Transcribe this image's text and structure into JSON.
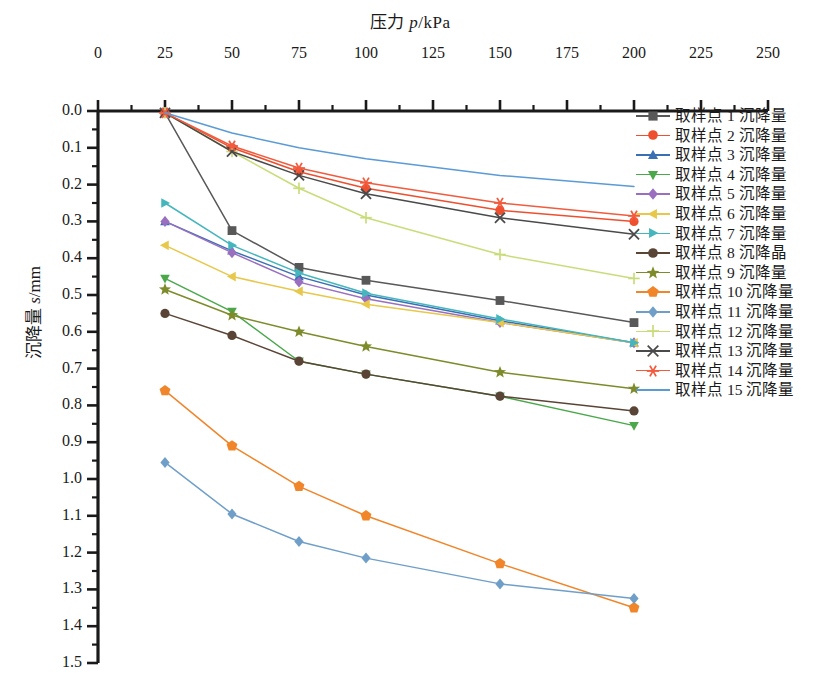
{
  "chart_data": {
    "type": "line",
    "title": "",
    "xlabel": "压力 p/kPa",
    "ylabel": "沉降量 s/mm",
    "xlabel_main": "压力 ",
    "xlabel_ital": "p",
    "xlabel_unit": "/kPa",
    "ylabel_main": "沉降量 ",
    "ylabel_ital": "s",
    "ylabel_unit": "/mm",
    "x_axis_position": "top",
    "y_axis_inverted": true,
    "grid": false,
    "legend_position": "right",
    "xlim": [
      0,
      250
    ],
    "ylim": [
      0.0,
      1.5
    ],
    "xticks": [
      0,
      25,
      50,
      75,
      100,
      125,
      150,
      175,
      200,
      225,
      250
    ],
    "xtick_labels": [
      "0",
      "25",
      "50",
      "75",
      "100",
      "125",
      "150",
      "175",
      "200",
      "225",
      "250"
    ],
    "x_minor_tick_interval": 12.5,
    "yticks": [
      0.0,
      0.1,
      0.2,
      0.3,
      0.4,
      0.5,
      0.6,
      0.7,
      0.8,
      0.9,
      1.0,
      1.1,
      1.2,
      1.3,
      1.4,
      1.5
    ],
    "ytick_labels": [
      "0.0",
      "0.1",
      "0.2",
      "0.3",
      "0.4",
      "0.5",
      "0.6",
      "0.7",
      "0.8",
      "0.9",
      "1.0",
      "1.1",
      "1.2",
      "1.3",
      "1.4",
      "1.5"
    ],
    "y_minor_tick_interval": 0.05,
    "x": [
      25,
      50,
      75,
      100,
      150,
      200
    ],
    "series": [
      {
        "name": "取样点 1 沉降量",
        "color": "#585858",
        "marker": "square",
        "values": [
          0.005,
          0.325,
          0.425,
          0.46,
          0.515,
          0.575
        ]
      },
      {
        "name": "取样点 2 沉降量",
        "color": "#ee4f2e",
        "marker": "circle",
        "values": [
          0.005,
          0.1,
          0.165,
          0.21,
          0.27,
          0.3
        ]
      },
      {
        "name": "取样点 3 沉降量",
        "color": "#3a6fb5",
        "marker": "triangle-up",
        "values": [
          0.3,
          0.38,
          0.45,
          0.5,
          0.57,
          0.63
        ]
      },
      {
        "name": "取样点 4 沉降量",
        "color": "#4aa84a",
        "marker": "triangle-down",
        "values": [
          0.455,
          0.545,
          0.68,
          0.715,
          0.775,
          0.855
        ]
      },
      {
        "name": "取样点 5 沉降量",
        "color": "#9a6fc0",
        "marker": "diamond",
        "values": [
          0.3,
          0.385,
          0.465,
          0.51,
          0.575,
          0.63
        ]
      },
      {
        "name": "取样点 6 沉降量",
        "color": "#e7c84a",
        "marker": "triangle-left",
        "values": [
          0.365,
          0.45,
          0.49,
          0.525,
          0.575,
          0.63
        ]
      },
      {
        "name": "取样点 7 沉降量",
        "color": "#45b6bd",
        "marker": "triangle-right",
        "values": [
          0.25,
          0.365,
          0.44,
          0.495,
          0.565,
          0.63
        ]
      },
      {
        "name": "取样点 8 沉降晶",
        "color": "#5a4436",
        "marker": "circle",
        "values": [
          0.55,
          0.61,
          0.68,
          0.715,
          0.775,
          0.815
        ]
      },
      {
        "name": "取样点 9 沉降量",
        "color": "#7d8b2a",
        "marker": "star",
        "values": [
          0.485,
          0.555,
          0.6,
          0.64,
          0.71,
          0.755
        ]
      },
      {
        "name": "取样点 10 沉降量",
        "color": "#f0852a",
        "marker": "pentagon",
        "values": [
          0.76,
          0.91,
          1.02,
          1.1,
          1.23,
          1.35
        ]
      },
      {
        "name": "取样点 11 沉降量",
        "color": "#6f9fc8",
        "marker": "diamond",
        "values": [
          0.955,
          1.095,
          1.17,
          1.215,
          1.285,
          1.325
        ]
      },
      {
        "name": "取样点 12 沉降量",
        "color": "#c8dd7a",
        "marker": "plus",
        "values": [
          0.005,
          0.11,
          0.21,
          0.29,
          0.39,
          0.455
        ]
      },
      {
        "name": "取样点 13 沉降量",
        "color": "#4a4a4a",
        "marker": "x",
        "values": [
          0.005,
          0.11,
          0.175,
          0.225,
          0.29,
          0.335
        ]
      },
      {
        "name": "取样点 14 沉降量",
        "color": "#f25b3d",
        "marker": "asterisk",
        "values": [
          0.005,
          0.095,
          0.155,
          0.195,
          0.25,
          0.285
        ]
      },
      {
        "name": "取样点 15 沉降量",
        "color": "#5b9bd5",
        "marker": "none",
        "values": [
          0.005,
          0.06,
          0.1,
          0.13,
          0.175,
          0.205
        ]
      }
    ]
  }
}
